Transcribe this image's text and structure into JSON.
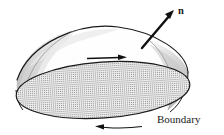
{
  "figure": {
    "kind": "oriented-surface-diagram",
    "background_color": "#ffffff",
    "ink_color": "#1a1a1a",
    "labels": {
      "normal_vector": "n",
      "boundary": "Boundary"
    },
    "colors": {
      "outline": "#1a1a1a",
      "stipple_fill": "#9a9a9a",
      "stipple_base": "#efefef",
      "shade_light": "#e2e2e2",
      "shade_mid": "#c9c9c9",
      "shade_dark": "#b3b3b3",
      "arrow": "#111111"
    },
    "geometry": {
      "base_ellipse": {
        "center_x": 103,
        "center_y": 90,
        "radius_x": 87,
        "radius_y": 28,
        "rotation_deg": -4
      },
      "dome_apex": {
        "x": 118,
        "y": 27
      },
      "dome_left_anchor": {
        "x": 17,
        "y": 80
      },
      "dome_right_anchor": {
        "x": 188,
        "y": 72
      }
    },
    "arrows": {
      "normal": {
        "name": "n",
        "from": {
          "x": 142,
          "y": 48
        },
        "to": {
          "x": 173,
          "y": 11
        },
        "label_position": {
          "x": 178,
          "y": 12
        },
        "stroke_width": 2.4,
        "head_length": 9
      },
      "surface_orientation": {
        "direction": "right",
        "from": {
          "x": 87,
          "y": 58
        },
        "to": {
          "x": 126,
          "y": 57
        },
        "stroke_width": 1.3,
        "head_length": 7
      },
      "boundary_orientation": {
        "direction": "left",
        "from": {
          "x": 140,
          "y": 127
        },
        "to": {
          "x": 96,
          "y": 126
        },
        "stroke_width": 1.2,
        "head_length": 7
      }
    },
    "boundary_label_position": {
      "x": 157,
      "y": 123
    }
  }
}
